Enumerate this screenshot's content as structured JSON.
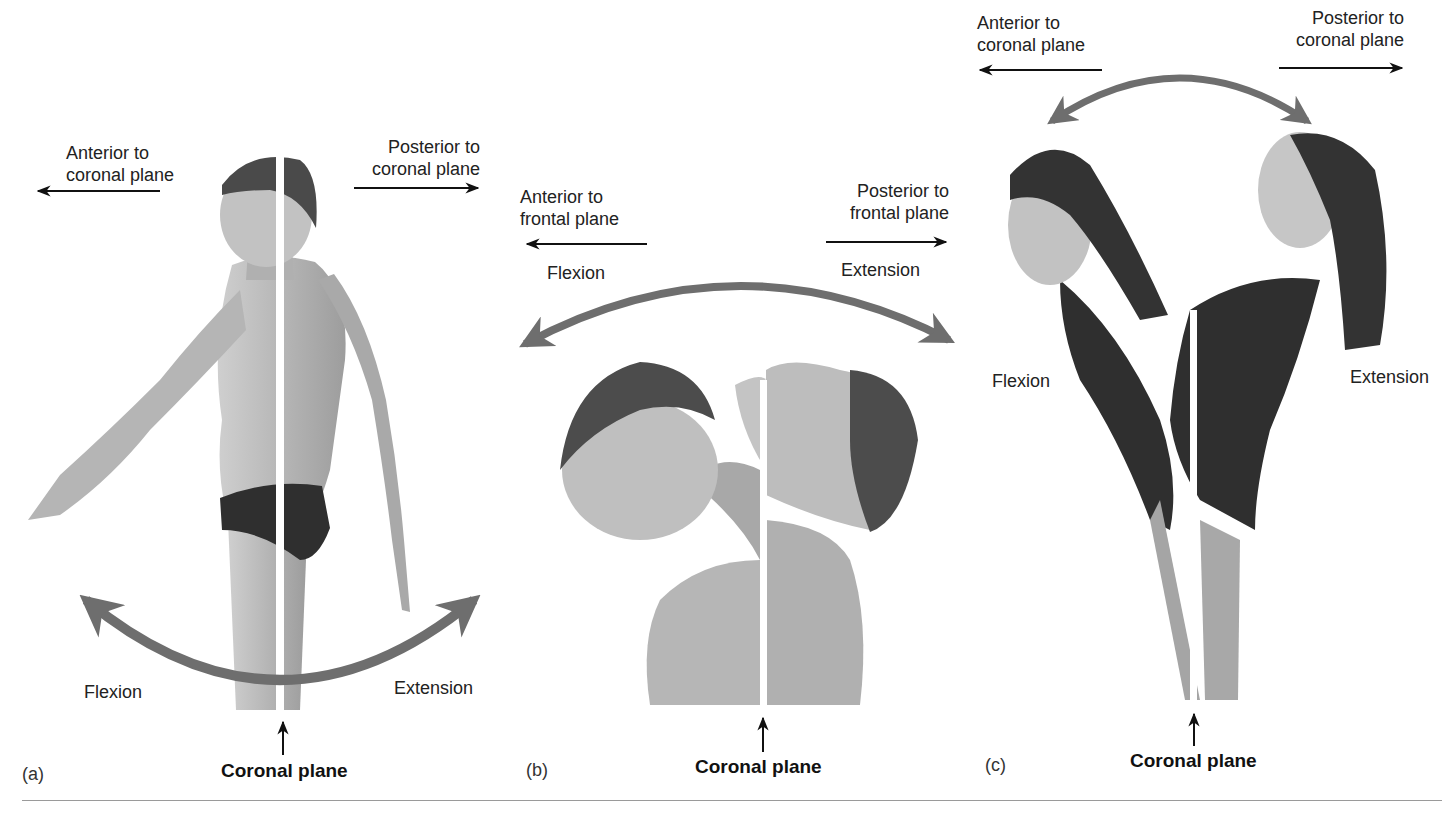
{
  "figure": {
    "panels": [
      {
        "id": "(a)",
        "subject": "standing figure, shoulder flexion/extension",
        "anterior_label": "Anterior to\ncoronal plane",
        "anterior_line1": "Anterior to",
        "anterior_line2": "coronal plane",
        "posterior_line1": "Posterior to",
        "posterior_line2": "coronal plane",
        "flexion": "Flexion",
        "extension": "Extension",
        "plane": "Coronal plane"
      },
      {
        "id": "(b)",
        "subject": "head/neck flexion and extension",
        "anterior_line1": "Anterior to",
        "anterior_line2": "frontal plane",
        "posterior_line1": "Posterior to",
        "posterior_line2": "frontal plane",
        "flexion": "Flexion",
        "extension": "Extension",
        "plane": "Coronal plane"
      },
      {
        "id": "(c)",
        "subject": "trunk flexion and extension",
        "anterior_line1": "Anterior to",
        "anterior_line2": "coronal plane",
        "posterior_line1": "Posterior to",
        "posterior_line2": "coronal plane",
        "flexion": "Flexion",
        "extension": "Extension",
        "plane": "Coronal plane"
      }
    ],
    "colors": {
      "arc": "#6e6e6e",
      "arrow": "#111111",
      "skin": "#b9b9b9",
      "hair": "#4a4a4a",
      "suit": "#2f2f2f",
      "plane_line": "#ffffff",
      "rule": "#9a9a9a"
    }
  }
}
